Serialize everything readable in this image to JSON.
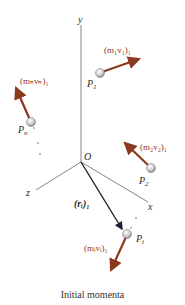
{
  "diagram": {
    "caption": "Initial momenta",
    "axes": {
      "x": "x",
      "y": "y",
      "z": "z",
      "origin": "O"
    },
    "particles": [
      {
        "label": "P",
        "sub": "1",
        "momentum": "(m₁v₁)₁"
      },
      {
        "label": "P",
        "sub": "2",
        "momentum": "(m₂v₂)₁"
      },
      {
        "label": "P",
        "sub": "n",
        "momentum": "(mₙvₙ)₁"
      },
      {
        "label": "P",
        "sub": "i",
        "momentum": "(mᵢvᵢ)₁"
      }
    ],
    "position_vector": "(rᵢ)₁",
    "colors": {
      "momentum_arrow": "#8b3a1e",
      "position_arrow": "#1a2030",
      "axis": "#555555",
      "particle": "#d0d0d0"
    }
  }
}
